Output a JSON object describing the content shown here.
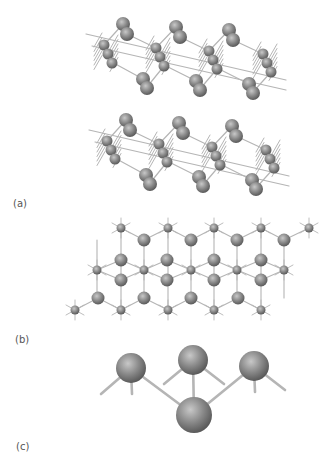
{
  "figure": {
    "panels": [
      {
        "id": "a",
        "label": "(a)",
        "description": "side view of stacked puckered layers"
      },
      {
        "id": "b",
        "label": "(b)",
        "description": "top view of honeycomb lattice"
      },
      {
        "id": "c",
        "label": "(c)",
        "description": "close-up of bonding unit (four atoms)"
      }
    ],
    "colors": {
      "atom_fill": "#8a8a8a",
      "atom_highlight": "#c8c8c8",
      "atom_shadow": "#5a5a5a",
      "bond": "#b5b5b5",
      "background": "#ffffff",
      "label": "#555555"
    }
  }
}
